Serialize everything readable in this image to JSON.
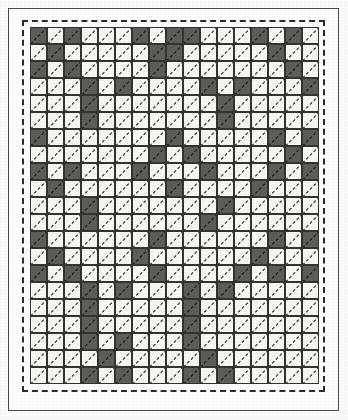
{
  "figure": {
    "type": "quilt-block-pattern-chart",
    "colors": {
      "dark_patch": "#5d5d5a",
      "light_patch": "#f7f7f3",
      "grid_line": "#33332f",
      "stitch_line": "#1b1b19",
      "dashed_seam_line": "#2b2b2b",
      "page_frame": "#4a4a4a",
      "paper": "#fdfdfc"
    },
    "legend": {
      "dark_label": "dark fabric",
      "light_label": "light fabric",
      "stitch_label": "diagonal quilting stitch"
    }
  },
  "chart_data": {
    "type": "heatmap",
    "xlabel": "",
    "ylabel": "",
    "columns": 17,
    "rows": 21,
    "cell_size_px": 17,
    "value_map": {
      "0": "light",
      "1": "dark"
    },
    "categories": [
      "light",
      "dark"
    ],
    "grid": [
      [
        1,
        0,
        1,
        0,
        0,
        0,
        1,
        0,
        1,
        1,
        0,
        0,
        0,
        1,
        0,
        1,
        0
      ],
      [
        0,
        1,
        0,
        0,
        0,
        0,
        0,
        1,
        1,
        0,
        0,
        0,
        0,
        0,
        1,
        0,
        0
      ],
      [
        1,
        0,
        1,
        0,
        0,
        0,
        0,
        1,
        0,
        0,
        0,
        0,
        0,
        0,
        0,
        1,
        0
      ],
      [
        0,
        0,
        0,
        1,
        0,
        1,
        0,
        0,
        0,
        0,
        1,
        0,
        1,
        0,
        0,
        0,
        1
      ],
      [
        0,
        0,
        0,
        1,
        0,
        0,
        0,
        0,
        0,
        0,
        0,
        1,
        0,
        0,
        0,
        0,
        0
      ],
      [
        0,
        0,
        0,
        1,
        0,
        0,
        0,
        0,
        0,
        0,
        0,
        1,
        0,
        0,
        0,
        0,
        0
      ],
      [
        1,
        0,
        0,
        0,
        0,
        0,
        0,
        0,
        1,
        0,
        0,
        0,
        0,
        0,
        1,
        0,
        1
      ],
      [
        0,
        0,
        0,
        0,
        0,
        0,
        0,
        1,
        0,
        1,
        0,
        0,
        0,
        0,
        0,
        1,
        0
      ],
      [
        1,
        0,
        1,
        0,
        0,
        0,
        1,
        0,
        0,
        0,
        1,
        0,
        0,
        0,
        1,
        0,
        1
      ],
      [
        0,
        1,
        0,
        0,
        0,
        0,
        0,
        0,
        1,
        0,
        0,
        0,
        0,
        1,
        0,
        0,
        0
      ],
      [
        0,
        0,
        0,
        1,
        0,
        0,
        0,
        0,
        0,
        0,
        0,
        1,
        0,
        0,
        0,
        0,
        0
      ],
      [
        0,
        0,
        0,
        1,
        0,
        0,
        0,
        0,
        0,
        0,
        1,
        0,
        0,
        0,
        0,
        0,
        0
      ],
      [
        1,
        0,
        0,
        0,
        0,
        0,
        0,
        1,
        0,
        0,
        0,
        0,
        0,
        0,
        1,
        0,
        1
      ],
      [
        0,
        1,
        0,
        0,
        0,
        0,
        1,
        0,
        0,
        0,
        0,
        0,
        0,
        1,
        0,
        0,
        0
      ],
      [
        1,
        0,
        1,
        0,
        0,
        0,
        0,
        1,
        0,
        0,
        0,
        0,
        1,
        0,
        1,
        0,
        1
      ],
      [
        0,
        0,
        0,
        1,
        0,
        1,
        0,
        0,
        0,
        1,
        0,
        1,
        0,
        0,
        0,
        0,
        0
      ],
      [
        0,
        0,
        0,
        1,
        0,
        0,
        0,
        0,
        0,
        1,
        0,
        0,
        0,
        0,
        0,
        0,
        0
      ],
      [
        0,
        0,
        0,
        1,
        0,
        0,
        0,
        0,
        0,
        1,
        0,
        0,
        0,
        0,
        0,
        0,
        0
      ],
      [
        0,
        0,
        0,
        1,
        0,
        1,
        0,
        0,
        0,
        1,
        0,
        0,
        0,
        0,
        0,
        0,
        0
      ],
      [
        0,
        0,
        0,
        0,
        1,
        0,
        0,
        0,
        0,
        0,
        1,
        0,
        0,
        0,
        0,
        0,
        0
      ],
      [
        0,
        0,
        0,
        1,
        0,
        1,
        0,
        0,
        0,
        1,
        0,
        1,
        0,
        0,
        0,
        0,
        0
      ]
    ]
  }
}
